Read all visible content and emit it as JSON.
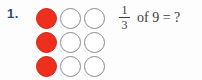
{
  "problem": {
    "number_label": "1.",
    "fraction": {
      "numerator": "1",
      "denominator": "3"
    },
    "expression_suffix": "of 9 = ?",
    "full_expression": "1/3 of 9 = ?",
    "grid": {
      "rows": 3,
      "cols": 3,
      "circles": [
        [
          "filled",
          "empty",
          "empty"
        ],
        [
          "filled",
          "empty",
          "empty"
        ],
        [
          "filled",
          "empty",
          "empty"
        ]
      ],
      "filled_count": 3,
      "total_count": 9
    },
    "colors": {
      "filled_circle": "#ee2f1e",
      "filled_circle_border": "#cf2318",
      "empty_circle_border": "#8b8b8b",
      "number_label": "#2b4a7d",
      "text": "#3b3b3b",
      "background": "#fdfdfd"
    }
  }
}
